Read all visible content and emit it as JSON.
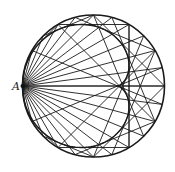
{
  "diagram": {
    "title": "",
    "type": "circle-reflection-caustic",
    "labels": [
      {
        "id": "A",
        "text": "A",
        "x": 12,
        "y": 90
      }
    ],
    "circle": {
      "cx": 93.5,
      "cy": 86,
      "r": 71,
      "stroke": "#1a1a1a"
    },
    "source_point": {
      "name": "A",
      "angle_deg": 180
    },
    "ray_count": 24,
    "line_color": "#1a1a1a"
  }
}
